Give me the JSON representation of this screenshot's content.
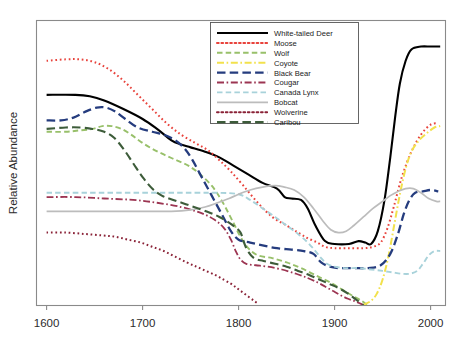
{
  "chart_data": {
    "type": "line",
    "title": "",
    "xlabel": "",
    "ylabel": "Relative Abundance",
    "xlim": [
      1590,
      2015
    ],
    "ylim": [
      0,
      100
    ],
    "grid": false,
    "legend_position": "top-right",
    "xticks": [
      "1600",
      "1700",
      "1800",
      "1900",
      "2000"
    ],
    "xtick_values": [
      1600,
      1700,
      1800,
      1900,
      2000
    ],
    "yticks": [],
    "series": [
      {
        "name": "White-tailed Deer",
        "color": "#000000",
        "style": "solid",
        "width": 2.1,
        "x": [
          1600,
          1630,
          1645,
          1660,
          1680,
          1700,
          1715,
          1730,
          1740,
          1750,
          1765,
          1780,
          1795,
          1810,
          1825,
          1840,
          1848,
          1855,
          1865,
          1872,
          1880,
          1890,
          1900,
          1915,
          1925,
          1932,
          1938,
          1945,
          1952,
          1958,
          1963,
          1968,
          1974,
          1980,
          1990,
          2000,
          2010
        ],
        "y": [
          74,
          74,
          73.5,
          72,
          69,
          65.5,
          62,
          58,
          56.5,
          55.5,
          54,
          52,
          49,
          46,
          43,
          41,
          38,
          37.5,
          37,
          34,
          28,
          22.5,
          21.5,
          21.5,
          22.5,
          22,
          21.5,
          26,
          37,
          52,
          66,
          78,
          86,
          90,
          91,
          91,
          91
        ]
      },
      {
        "name": "Moose",
        "color": "#e8433c",
        "style": "dotted",
        "width": 2.0,
        "x": [
          1600,
          1620,
          1635,
          1650,
          1665,
          1680,
          1695,
          1710,
          1725,
          1740,
          1755,
          1768,
          1780,
          1792,
          1805,
          1820,
          1835,
          1850,
          1862,
          1872,
          1882,
          1890,
          1900,
          1915,
          1930,
          1940,
          1948,
          1955,
          1962,
          1970,
          1980,
          1990,
          2000,
          2008
        ],
        "y": [
          86,
          86.5,
          86.5,
          85.5,
          83,
          79,
          74,
          69,
          64,
          60,
          57,
          54.5,
          51,
          47,
          42,
          36,
          31,
          28,
          25.5,
          23.5,
          22,
          20.5,
          20,
          20,
          20,
          20.5,
          22,
          27,
          35,
          45,
          54,
          60,
          63.5,
          64
        ]
      },
      {
        "name": "Wolf",
        "color": "#98c06a",
        "style": "dashed",
        "width": 1.9,
        "x": [
          1600,
          1620,
          1635,
          1648,
          1658,
          1668,
          1678,
          1688,
          1698,
          1710,
          1722,
          1735,
          1748,
          1760,
          1772,
          1782,
          1790,
          1796,
          1802,
          1810,
          1820,
          1835,
          1850,
          1865,
          1880,
          1895,
          1910,
          1920,
          1928,
          1934
        ],
        "y": [
          61,
          61,
          61.5,
          62,
          63,
          63,
          62,
          60,
          57.5,
          55,
          53,
          51,
          49,
          46,
          42,
          37,
          32,
          28,
          24,
          20,
          17.5,
          16.5,
          15,
          13,
          10.5,
          8,
          5,
          3,
          1.5,
          0
        ]
      },
      {
        "name": "Coyote",
        "color": "#f2e14c",
        "style": "dashdot",
        "width": 2.0,
        "x": [
          1930,
          1938,
          1944,
          1950,
          1956,
          1962,
          1968,
          1974,
          1980,
          1988,
          1996,
          2004,
          2010
        ],
        "y": [
          0,
          1.5,
          4,
          9,
          17,
          28,
          39,
          48,
          54,
          58,
          60.5,
          62.5,
          63
        ]
      },
      {
        "name": "Black Bear",
        "color": "#253c7e",
        "style": "dashed-long",
        "width": 2.3,
        "x": [
          1600,
          1615,
          1628,
          1640,
          1652,
          1662,
          1672,
          1682,
          1695,
          1710,
          1722,
          1734,
          1744,
          1752,
          1760,
          1768,
          1776,
          1784,
          1792,
          1800,
          1812,
          1825,
          1840,
          1855,
          1868,
          1878,
          1886,
          1895,
          1905,
          1920,
          1935,
          1948,
          1958,
          1966,
          1972,
          1978,
          1984,
          1992,
          2000,
          2008
        ],
        "y": [
          65,
          65,
          66,
          68,
          69.5,
          69.5,
          68,
          65.5,
          62.5,
          61,
          60,
          58,
          55,
          51,
          46,
          41,
          36,
          31,
          26,
          23,
          22,
          21,
          20,
          19.5,
          19,
          18,
          15,
          13.5,
          13,
          13,
          13,
          14,
          18,
          25,
          32,
          37,
          39.5,
          40,
          40.5,
          40
        ]
      },
      {
        "name": "Cougar",
        "color": "#9c3552",
        "style": "dashdot",
        "width": 1.8,
        "x": [
          1600,
          1630,
          1660,
          1690,
          1715,
          1740,
          1760,
          1775,
          1785,
          1792,
          1797,
          1802,
          1808,
          1818,
          1830,
          1845,
          1860,
          1872,
          1882,
          1890,
          1898,
          1906,
          1914,
          1922,
          1930
        ],
        "y": [
          38,
          38,
          37.5,
          37,
          36,
          34.5,
          32.5,
          30,
          27,
          23,
          19,
          16,
          14.5,
          14,
          13.5,
          12.5,
          11,
          9.5,
          8,
          6.5,
          5,
          3.5,
          2.2,
          1.2,
          0
        ]
      },
      {
        "name": "Canada Lynx",
        "color": "#a8d2da",
        "style": "dashed",
        "width": 1.9,
        "x": [
          1600,
          1640,
          1680,
          1720,
          1755,
          1780,
          1800,
          1812,
          1825,
          1838,
          1850,
          1862,
          1872,
          1880,
          1886,
          1892,
          1900,
          1912,
          1925,
          1938,
          1950,
          1960,
          1970,
          1978,
          1986,
          1992,
          1998,
          2004,
          2010
        ],
        "y": [
          39.5,
          39.5,
          39.5,
          39.5,
          39.5,
          39.5,
          39,
          37,
          34,
          31,
          28,
          25,
          22,
          19,
          16.5,
          14.5,
          13.5,
          13,
          13,
          12.5,
          12,
          11.5,
          11,
          11,
          12,
          14.5,
          17.5,
          19,
          19
        ]
      },
      {
        "name": "Bobcat",
        "color": "#bcbcbc",
        "style": "solid",
        "width": 1.7,
        "x": [
          1600,
          1650,
          1700,
          1730,
          1750,
          1765,
          1778,
          1790,
          1800,
          1812,
          1825,
          1838,
          1848,
          1858,
          1868,
          1878,
          1888,
          1896,
          1904,
          1912,
          1920,
          1930,
          1940,
          1950,
          1958,
          1966,
          1974,
          1982,
          1990,
          1998,
          2006,
          2010
        ],
        "y": [
          33,
          33,
          33,
          33,
          33.5,
          34.5,
          36,
          37.5,
          39,
          40.5,
          41.5,
          42,
          41.5,
          40.5,
          38,
          34,
          29.5,
          26.5,
          25.5,
          26,
          28,
          31,
          34,
          36.5,
          38.5,
          40,
          41,
          41,
          39.5,
          37.5,
          36.5,
          36.5
        ]
      },
      {
        "name": "Wolverine",
        "color": "#8a2237",
        "style": "dotted",
        "width": 2.0,
        "x": [
          1600,
          1620,
          1640,
          1658,
          1672,
          1685,
          1698,
          1710,
          1722,
          1734,
          1746,
          1756,
          1766,
          1776,
          1784,
          1792,
          1798,
          1804,
          1810,
          1816,
          1820
        ],
        "y": [
          25.5,
          25.5,
          25,
          24.5,
          24,
          23,
          22,
          20.5,
          19,
          17,
          15,
          13.5,
          12,
          10.5,
          9,
          7.5,
          6,
          4.5,
          3,
          1.5,
          0.5
        ]
      },
      {
        "name": "Caribou",
        "color": "#3d5c3a",
        "style": "dashed-long",
        "width": 2.1,
        "x": [
          1600,
          1620,
          1635,
          1648,
          1660,
          1670,
          1680,
          1690,
          1700,
          1710,
          1720,
          1732,
          1745,
          1758,
          1770,
          1780,
          1790,
          1796,
          1802,
          1808,
          1816,
          1826,
          1838,
          1850,
          1862,
          1874,
          1884,
          1894,
          1904,
          1914,
          1922,
          1930
        ],
        "y": [
          62,
          62.5,
          62.5,
          62,
          61,
          59,
          55,
          50,
          45,
          41,
          38.5,
          37,
          35.5,
          34,
          32.5,
          31,
          29,
          27.5,
          25.5,
          20,
          16.5,
          15.5,
          14.5,
          13.5,
          12,
          10.5,
          9,
          7.5,
          6,
          4,
          2,
          0
        ]
      }
    ]
  },
  "legend": {
    "entries": [
      {
        "label": "White-tailed Deer"
      },
      {
        "label": "Moose"
      },
      {
        "label": "Wolf"
      },
      {
        "label": "Coyote"
      },
      {
        "label": "Black Bear"
      },
      {
        "label": "Cougar"
      },
      {
        "label": "Canada Lynx"
      },
      {
        "label": "Bobcat"
      },
      {
        "label": "Wolverine"
      },
      {
        "label": "Caribou"
      }
    ]
  }
}
